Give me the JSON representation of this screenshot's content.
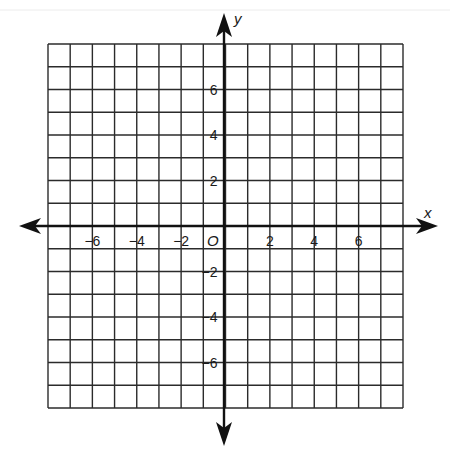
{
  "figure": {
    "type": "coordinate-plane",
    "axis_labels": {
      "x": "x",
      "y": "y"
    },
    "origin_label": "O",
    "grid": {
      "cols": 16,
      "rows": 16,
      "x_min": -8,
      "x_max": 8,
      "y_min": -8,
      "y_max": 8
    },
    "x_ticks": [
      {
        "value": -6,
        "label": "−6"
      },
      {
        "value": -4,
        "label": "−4"
      },
      {
        "value": -2,
        "label": "−2"
      },
      {
        "value": 2,
        "label": "2"
      },
      {
        "value": 4,
        "label": "4"
      },
      {
        "value": 6,
        "label": "6"
      }
    ],
    "y_ticks": [
      {
        "value": 6,
        "label": "6"
      },
      {
        "value": 4,
        "label": "4"
      },
      {
        "value": 2,
        "label": "2"
      },
      {
        "value": -2,
        "label": "−2"
      },
      {
        "value": -4,
        "label": "−4"
      },
      {
        "value": -6,
        "label": "−6"
      }
    ],
    "colors": {
      "grid": "#2b2b2b",
      "axis": "#111111",
      "text": "#1a1a1a",
      "background": "#ffffff"
    }
  }
}
